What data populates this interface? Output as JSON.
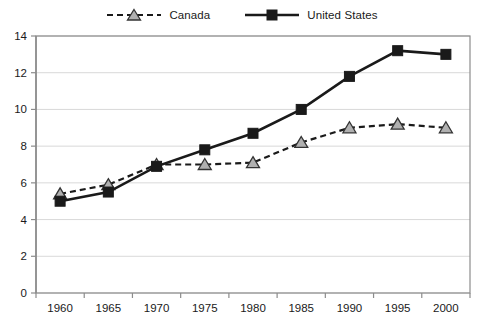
{
  "legend": {
    "position": "top-center",
    "items": [
      {
        "label": "Canada",
        "marker": "triangle",
        "line": "dashed",
        "marker_fill": "#b0b0b0",
        "line_color": "#1a1a1a"
      },
      {
        "label": "United States",
        "marker": "square",
        "line": "solid",
        "marker_fill": "#1a1a1a",
        "line_color": "#1a1a1a"
      }
    ]
  },
  "chart_data": {
    "type": "line",
    "title": "",
    "subtitle": "",
    "xlabel": "",
    "ylabel": "",
    "categories": [
      "1960",
      "1965",
      "1970",
      "1975",
      "1980",
      "1985",
      "1990",
      "1995",
      "2000"
    ],
    "x": [
      1960,
      1965,
      1970,
      1975,
      1980,
      1985,
      1990,
      1995,
      2000
    ],
    "series": [
      {
        "name": "Canada",
        "values": [
          5.4,
          5.9,
          7.0,
          7.0,
          7.1,
          8.2,
          9.0,
          9.2,
          9.0
        ],
        "line_style": "dashed",
        "marker": "triangle",
        "marker_fill": "#b0b0b0",
        "color": "#1a1a1a"
      },
      {
        "name": "United States",
        "values": [
          5.0,
          5.5,
          6.9,
          7.8,
          8.7,
          10.0,
          11.8,
          13.2,
          13.0
        ],
        "line_style": "solid",
        "marker": "square",
        "marker_fill": "#1a1a1a",
        "color": "#1a1a1a"
      }
    ],
    "ylim": [
      0,
      14
    ],
    "yticks": [
      0,
      2,
      4,
      6,
      8,
      10,
      12,
      14
    ],
    "ytick_labels": [
      "0",
      "2",
      "4",
      "6",
      "8",
      "10",
      "12",
      "14"
    ],
    "xtick_labels": [
      "1960",
      "1965",
      "1970",
      "1975",
      "1980",
      "1985",
      "1990",
      "1995",
      "2000"
    ],
    "grid": {
      "horizontal": true,
      "vertical": false,
      "color": "#d9d9d9"
    },
    "axis_color": "#8c8c8c",
    "plot_border": true,
    "legend_position": "top-center"
  }
}
